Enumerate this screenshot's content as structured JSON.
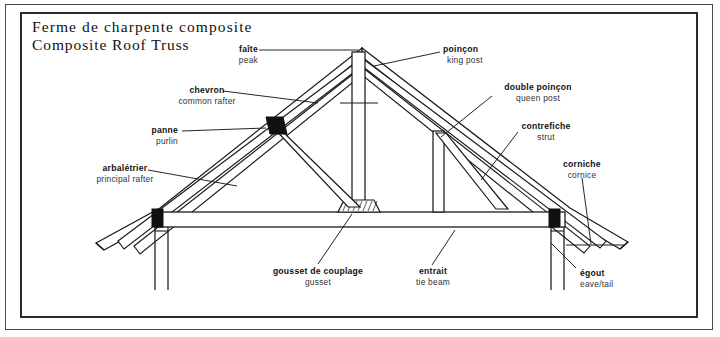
{
  "title": {
    "french": "Ferme de charpente composite",
    "english": "Composite Roof Truss"
  },
  "labels": [
    {
      "key": "peak",
      "fr": "faîte",
      "en": "peak"
    },
    {
      "key": "king_post",
      "fr": "poinçon",
      "en": "king post"
    },
    {
      "key": "common_rafter",
      "fr": "chevron",
      "en": "common rafter"
    },
    {
      "key": "queen_post",
      "fr": "double poinçon",
      "en": "queen post"
    },
    {
      "key": "purlin",
      "fr": "panne",
      "en": "purlin"
    },
    {
      "key": "strut",
      "fr": "contrefiche",
      "en": "strut"
    },
    {
      "key": "principal_rafter",
      "fr": "arbalétrier",
      "en": "principal rafter"
    },
    {
      "key": "cornice",
      "fr": "corniche",
      "en": "cornice"
    },
    {
      "key": "gusset",
      "fr": "gousset de couplage",
      "en": "gusset"
    },
    {
      "key": "tie_beam",
      "fr": "entrait",
      "en": "tie beam"
    },
    {
      "key": "eave",
      "fr": "égout",
      "en": "eave/tail"
    }
  ],
  "colors": {
    "line": "#1a1a1a",
    "fill_solid": "#111111",
    "paper": "#ffffff",
    "frame": "#2b2b2b"
  },
  "diagram": {
    "type": "technical-line-drawing",
    "apex": {
      "x": 362,
      "y": 48
    },
    "tie_beam": {
      "x1": 155,
      "x2": 565,
      "top": 212,
      "bottom": 227
    }
  }
}
